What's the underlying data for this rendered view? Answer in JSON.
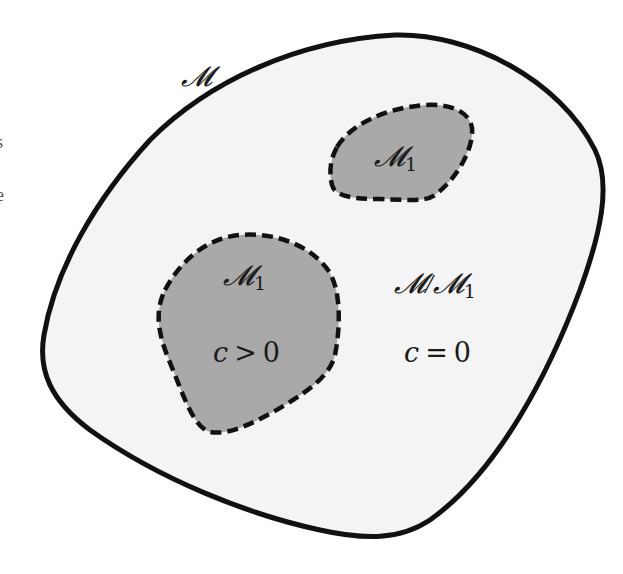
{
  "diagram": {
    "outer_set": {
      "label": "𝓜",
      "fill": "#f4f4f4",
      "stroke": "#111111",
      "style": "solid"
    },
    "subset_small": {
      "label_main": "𝓜",
      "label_sub": "1",
      "fill": "#a9a9a9",
      "stroke": "#111111",
      "style": "dashed"
    },
    "subset_large": {
      "label_main": "𝓜",
      "label_sub": "1",
      "condition": "c > 0",
      "condition_var": "c",
      "condition_op": ">",
      "condition_val": "0",
      "fill": "#a9a9a9",
      "stroke": "#111111",
      "style": "dashed"
    },
    "complement": {
      "label_main": "𝓜/𝓜",
      "label_sub": "1",
      "condition": "c = 0",
      "condition_var": "c",
      "condition_op": "=",
      "condition_val": "0"
    },
    "edge_fragments": [
      "s",
      "e"
    ]
  }
}
